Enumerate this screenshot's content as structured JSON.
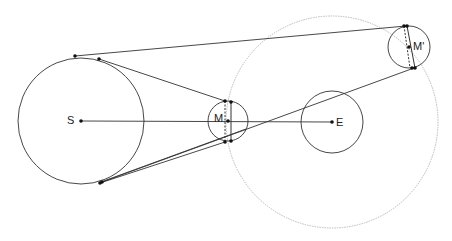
{
  "diagram": {
    "title": "",
    "colors": {
      "line": "#333333",
      "orbit": "#bbbbbb",
      "point": "#111111",
      "background": "#ffffff"
    },
    "bodies": [
      {
        "id": "S",
        "label": "S",
        "cx": 81,
        "cy": 121,
        "r": 63
      },
      {
        "id": "M",
        "label": "M",
        "cx": 228,
        "cy": 121,
        "r": 20
      },
      {
        "id": "E",
        "label": "E",
        "cx": 332,
        "cy": 122,
        "r": 31
      },
      {
        "id": "M_prime",
        "label": "M'",
        "cx": 409,
        "cy": 47,
        "r": 21
      }
    ],
    "orbit": {
      "label": "",
      "cx": 332,
      "cy": 122,
      "r": 106,
      "style": "dotted"
    },
    "lines": [
      {
        "from": "S",
        "to": "E",
        "x1": 81,
        "y1": 121,
        "x2": 332,
        "y2": 122
      },
      {
        "desc": "S top tangent to M' top",
        "x1": 75,
        "y1": 56,
        "x2": 406,
        "y2": 26
      },
      {
        "desc": "S top tangent to M top",
        "x1": 99,
        "y1": 59,
        "x2": 225,
        "y2": 101
      },
      {
        "desc": "S bottom to M bottom",
        "x1": 100,
        "y1": 183,
        "x2": 225,
        "y2": 142
      },
      {
        "desc": "S bottom to M right-bottom",
        "x1": 101,
        "y1": 182,
        "x2": 246,
        "y2": 129
      },
      {
        "desc": "S bottom to M' bottom",
        "x1": 102,
        "y1": 182,
        "x2": 414,
        "y2": 68
      }
    ],
    "chords": [
      {
        "desc": "M dashed chord",
        "x1": 225,
        "y1": 101,
        "x2": 225,
        "y2": 142,
        "style": "dashed"
      },
      {
        "desc": "M solid chord",
        "x1": 231,
        "y1": 102,
        "x2": 231,
        "y2": 141,
        "style": "solid"
      },
      {
        "desc": "M' dashed chord",
        "x1": 404,
        "y1": 26,
        "x2": 410,
        "y2": 68,
        "style": "dashed"
      },
      {
        "desc": "M' solid chord",
        "x1": 407,
        "y1": 26,
        "x2": 415,
        "y2": 68,
        "style": "solid"
      }
    ],
    "points": [
      {
        "x": 81,
        "y": 121
      },
      {
        "x": 228,
        "y": 121
      },
      {
        "x": 332,
        "y": 122
      },
      {
        "x": 409,
        "y": 47
      },
      {
        "x": 75,
        "y": 56
      },
      {
        "x": 99,
        "y": 59
      },
      {
        "x": 100,
        "y": 183
      },
      {
        "x": 102,
        "y": 182
      },
      {
        "x": 225,
        "y": 101
      },
      {
        "x": 231,
        "y": 102
      },
      {
        "x": 225,
        "y": 142
      },
      {
        "x": 231,
        "y": 141
      },
      {
        "x": 404,
        "y": 26
      },
      {
        "x": 407,
        "y": 26
      },
      {
        "x": 412,
        "y": 68
      },
      {
        "x": 415,
        "y": 68
      }
    ],
    "labels": {
      "S": {
        "text": "S",
        "x": 67,
        "y": 115
      },
      "M": {
        "text": "M",
        "x": 214,
        "y": 112
      },
      "E": {
        "text": "E",
        "x": 336,
        "y": 116
      },
      "M_prime": {
        "text": "M'",
        "x": 413,
        "y": 41
      }
    }
  }
}
